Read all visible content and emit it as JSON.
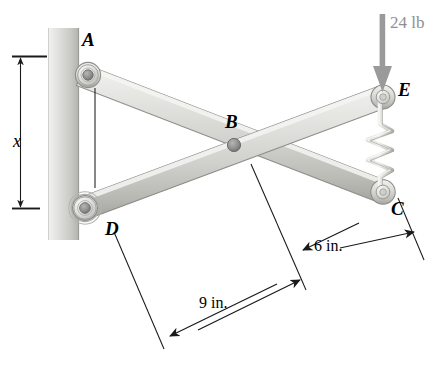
{
  "figure": {
    "background_color": "#ffffff"
  },
  "labels": {
    "A": "A",
    "B": "B",
    "C": "C",
    "D": "D",
    "E": "E"
  },
  "dimensions": {
    "x_label": "x",
    "nine_in": "9 in.",
    "six_in": "6 in."
  },
  "load": {
    "value": "24 lb",
    "direction": "down",
    "color": "#9a9a9a"
  },
  "colors": {
    "bar_light": "#e8e8e6",
    "bar_mid": "#cfcfcb",
    "bar_dark": "#a7a7a3",
    "wall_light": "#e4e4e2",
    "wall_dark": "#b9b9b5",
    "pin": "#8c8c8c",
    "line": "#1a1a1a",
    "load": "#9a9a9a"
  },
  "elements": {
    "wall_name": "fixed-wall",
    "bar_ac_name": "bar-A-to-C",
    "bar_de_name": "bar-D-to-E",
    "spring_name": "spring-E-to-C",
    "pin_a": "pin-A",
    "pin_b": "pin-B",
    "pin_c": "pin-C",
    "pin_d": "pin-D",
    "pin_e": "pin-E"
  }
}
